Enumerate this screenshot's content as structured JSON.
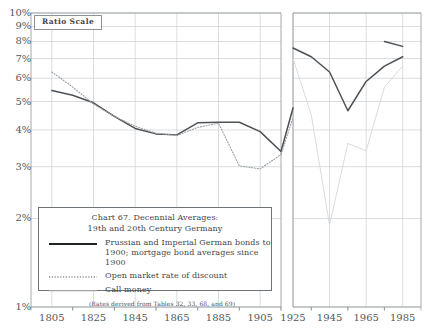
{
  "annotations": {
    "ratio_scale_label": "Ratio Scale"
  },
  "legend": {
    "title_line1": "Chart 67. Decennial Averages:",
    "title_line2": "19th and 20th Century Germany",
    "entries": [
      {
        "style": "solid",
        "text_line1": "Prussian and Imperial German bonds to",
        "text_line2": "1900; mortgage bond averages since 1900"
      },
      {
        "style": "dotted",
        "text_line1": "Open market rate of discount",
        "text_line2": ""
      },
      {
        "style": "light",
        "text_line1": "Call money",
        "text_line2": ""
      }
    ],
    "note": "(Rates derived from Tables 32, 33, 68, and 69)"
  },
  "colors": {
    "bonds": "#4c5155",
    "discount": "#9aa0a4",
    "call_money": "#d8dcdf",
    "grid": "#c9ced2",
    "axis": "#8d9296",
    "text": "#54595d"
  },
  "chart_data": {
    "type": "line",
    "title": "Chart 67. Decennial Averages: 19th and 20th Century Germany",
    "xlabel": "",
    "ylabel": "",
    "yscale": "log",
    "ylim": [
      1,
      10
    ],
    "ytick_values": [
      1,
      2,
      3,
      4,
      5,
      6,
      7,
      8,
      9,
      10
    ],
    "ytick_labels": [
      "1%",
      "2%",
      "3%",
      "4%",
      "5%",
      "6%",
      "7%",
      "8%",
      "9%",
      "10%"
    ],
    "xtick_values": [
      1805,
      1825,
      1845,
      1865,
      1885,
      1905,
      1925,
      1945,
      1965,
      1985
    ],
    "xtick_labels": [
      "1805",
      "1825",
      "1845",
      "1865",
      "1885",
      "1905",
      "1925",
      "1945",
      "1965",
      "1985"
    ],
    "xlim": [
      1795,
      1995
    ],
    "grid": true,
    "legend_position": "lower-left-inset",
    "axis_break": {
      "after": 1915,
      "before": 1925
    },
    "series": [
      {
        "name": "Prussian and Imperial German bonds to 1900; mortgage bond averages since 1900",
        "style": "solid",
        "color": "#4c5155",
        "segments": [
          {
            "x": [
              1805,
              1815,
              1825,
              1835,
              1845,
              1855,
              1865,
              1875,
              1885,
              1895,
              1905,
              1915
            ],
            "y": [
              5.45,
              5.25,
              4.95,
              4.45,
              4.05,
              3.88,
              3.85,
              4.23,
              4.25,
              4.25,
              3.95,
              3.38
            ]
          },
          {
            "x": [
              1915,
              1925
            ],
            "y": [
              3.38,
              4.75
            ]
          },
          {
            "x": [
              1925,
              1935,
              1945,
              1955,
              1965,
              1975,
              1985
            ],
            "y": [
              7.6,
              7.1,
              6.3,
              4.65,
              5.85,
              6.6,
              7.1
            ]
          },
          {
            "x": [
              1975,
              1985
            ],
            "y": [
              8.0,
              7.7
            ]
          }
        ]
      },
      {
        "name": "Open market rate of discount",
        "style": "dotted",
        "color": "#9aa0a4",
        "segments": [
          {
            "x": [
              1805,
              1815,
              1825,
              1835,
              1845,
              1855,
              1865,
              1875,
              1885,
              1895,
              1905,
              1915
            ],
            "y": [
              6.3,
              5.6,
              4.9,
              4.45,
              4.12,
              3.9,
              3.83,
              4.08,
              4.22,
              3.02,
              2.95,
              3.3
            ]
          },
          {
            "x": [
              1915,
              1925
            ],
            "y": [
              3.3,
              4.4
            ]
          }
        ]
      },
      {
        "name": "Call money",
        "style": "light",
        "color": "#d8dcdf",
        "segments": [
          {
            "x": [
              1925,
              1935,
              1945,
              1955,
              1965,
              1975,
              1985
            ],
            "y": [
              7.0,
              4.5,
              1.9,
              3.6,
              3.4,
              5.6,
              6.6
            ]
          }
        ]
      }
    ]
  }
}
